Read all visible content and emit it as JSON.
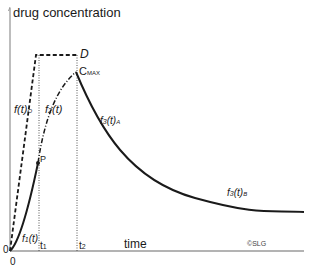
{
  "diagram": {
    "y_axis_label": "drug concentration",
    "x_axis_label": "time",
    "origin_y_label": "0",
    "origin_x_label": "0",
    "copyright": "©SLG",
    "points": {
      "D": "D",
      "P": "P",
      "cmax_main": "C",
      "cmax_sub": "MAX"
    },
    "time_marks": [
      {
        "main": "t",
        "sub": "1"
      },
      {
        "main": "t",
        "sub": "2"
      }
    ],
    "curves": {
      "f_o": {
        "main": "f(t)",
        "sub": "O"
      },
      "f1": {
        "main": "f",
        "sub1": "1",
        "rest": "(t)"
      },
      "f2": {
        "main": "f",
        "sub1": "2",
        "rest": "(t)"
      },
      "f3A": {
        "main": "f",
        "sub1": "3",
        "rest": "(t)",
        "sub2": "A"
      },
      "f3B": {
        "main": "f",
        "sub1": "3",
        "rest": "(t)",
        "sub2": "B"
      }
    },
    "colors": {
      "axis": "#9a9a9a",
      "curve": "#1a1a1a",
      "dotted": "#555555"
    }
  }
}
